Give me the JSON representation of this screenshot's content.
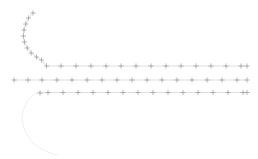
{
  "canvas": {
    "width": 258,
    "height": 159,
    "background": "#ffffff"
  },
  "style": {
    "line_color": "#c9c9cf",
    "marker_color": "#9a9aa6",
    "ghost_color": "#ececf0",
    "line_width": 0.6,
    "marker_width": 0.7,
    "marker_size": 2.6,
    "ghost_width": 0.9
  },
  "chart_data": {
    "type": "line",
    "title": "",
    "subtitle": "",
    "xlabel": "",
    "ylabel": "",
    "xlim": [
      0,
      258
    ],
    "ylim": [
      159,
      0
    ],
    "grid": false,
    "legend": "none",
    "axes_visible": false,
    "tick_labels_x": [],
    "tick_labels_y": [],
    "annotations": [],
    "series": [
      {
        "name": "trace-1-elbow",
        "marker": "plus",
        "color": "#c9c9cf",
        "points": [
          [
            33,
            13
          ],
          [
            28.5,
            18
          ],
          [
            25.8,
            24
          ],
          [
            24.0,
            30
          ],
          [
            23.4,
            36
          ],
          [
            24.4,
            42
          ],
          [
            27.2,
            48
          ],
          [
            31.2,
            53
          ],
          [
            36.5,
            57
          ],
          [
            41.5,
            60
          ],
          [
            46.5,
            66
          ],
          [
            61,
            66
          ],
          [
            76,
            66
          ],
          [
            91,
            66
          ],
          [
            106,
            66
          ],
          [
            121,
            66
          ],
          [
            136,
            66
          ],
          [
            151,
            66
          ],
          [
            166,
            66
          ],
          [
            181,
            66
          ],
          [
            196,
            66
          ],
          [
            211,
            66
          ],
          [
            226,
            66
          ],
          [
            241,
            66
          ],
          [
            247,
            66
          ]
        ]
      },
      {
        "name": "trace-2-flat",
        "marker": "plus",
        "color": "#c9c9cf",
        "points": [
          [
            14,
            80
          ],
          [
            28,
            80
          ],
          [
            42,
            80
          ],
          [
            57,
            80
          ],
          [
            72,
            80
          ],
          [
            87,
            80
          ],
          [
            102,
            80
          ],
          [
            117,
            80
          ],
          [
            132,
            80
          ],
          [
            147,
            80
          ],
          [
            162,
            80
          ],
          [
            177,
            80
          ],
          [
            192,
            80
          ],
          [
            207,
            80
          ],
          [
            222,
            80
          ],
          [
            237,
            80
          ],
          [
            247,
            80
          ]
        ]
      },
      {
        "name": "trace-3-flat",
        "marker": "plus",
        "color": "#c9c9cf",
        "points": [
          [
            40,
            93
          ],
          [
            48,
            92.5
          ],
          [
            63,
            92.5
          ],
          [
            78,
            92.5
          ],
          [
            93,
            92.5
          ],
          [
            108,
            92.5
          ],
          [
            123,
            92.5
          ],
          [
            138,
            92.5
          ],
          [
            153,
            92.5
          ],
          [
            168,
            92.5
          ],
          [
            183,
            92.5
          ],
          [
            198,
            92.5
          ],
          [
            213,
            92.5
          ],
          [
            228,
            92.5
          ],
          [
            243,
            92.5
          ],
          [
            247,
            92.5
          ]
        ]
      }
    ],
    "ghost_paths": [
      {
        "name": "ghost-arc-lower-left",
        "color": "#ececf0",
        "points": [
          [
            41,
            91
          ],
          [
            34,
            94
          ],
          [
            28,
            100
          ],
          [
            24,
            108
          ],
          [
            22,
            117
          ],
          [
            23,
            126
          ],
          [
            27,
            135
          ],
          [
            33,
            143
          ],
          [
            41,
            149
          ],
          [
            50,
            153
          ],
          [
            57,
            155
          ]
        ]
      }
    ]
  }
}
